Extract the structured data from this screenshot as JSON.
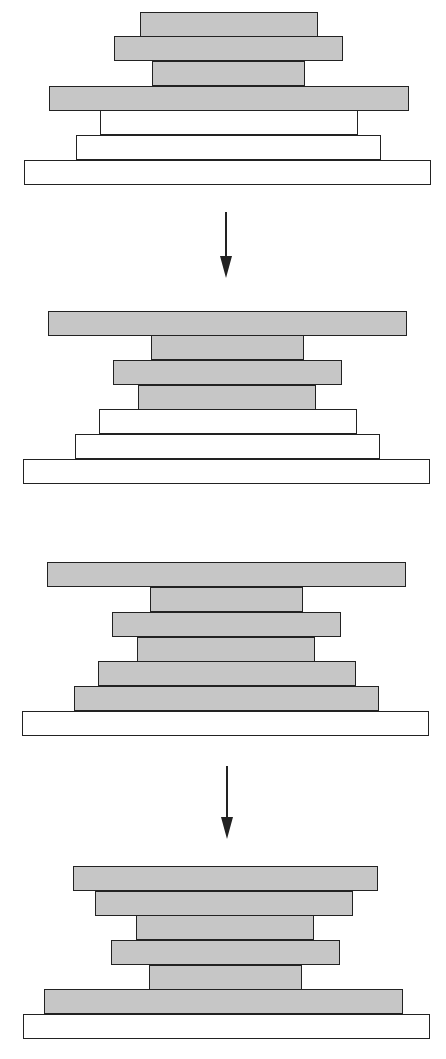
{
  "colors": {
    "background": "#ffffff",
    "gray_fill": "#c6c6c6",
    "white_fill": "#ffffff",
    "stroke": "#222222"
  },
  "diagram": {
    "stacks": [
      {
        "id": "stack-1",
        "bars": [
          {
            "x": 140,
            "y": 12,
            "w": 178,
            "h": 25,
            "fill": "gray"
          },
          {
            "x": 114,
            "y": 36,
            "w": 229,
            "h": 25,
            "fill": "gray"
          },
          {
            "x": 152,
            "y": 61,
            "w": 153,
            "h": 25,
            "fill": "gray"
          },
          {
            "x": 49,
            "y": 86,
            "w": 360,
            "h": 25,
            "fill": "gray"
          },
          {
            "x": 100,
            "y": 110,
            "w": 258,
            "h": 25,
            "fill": "white"
          },
          {
            "x": 76,
            "y": 135,
            "w": 305,
            "h": 25,
            "fill": "white"
          },
          {
            "x": 24,
            "y": 160,
            "w": 407,
            "h": 25,
            "fill": "white"
          }
        ]
      },
      {
        "id": "stack-2",
        "bars": [
          {
            "x": 48,
            "y": 311,
            "w": 359,
            "h": 25,
            "fill": "gray"
          },
          {
            "x": 151,
            "y": 335,
            "w": 153,
            "h": 25,
            "fill": "gray"
          },
          {
            "x": 113,
            "y": 360,
            "w": 229,
            "h": 25,
            "fill": "gray"
          },
          {
            "x": 138,
            "y": 385,
            "w": 178,
            "h": 25,
            "fill": "gray"
          },
          {
            "x": 99,
            "y": 409,
            "w": 258,
            "h": 25,
            "fill": "white"
          },
          {
            "x": 75,
            "y": 434,
            "w": 305,
            "h": 25,
            "fill": "white"
          },
          {
            "x": 23,
            "y": 459,
            "w": 407,
            "h": 25,
            "fill": "white"
          }
        ]
      },
      {
        "id": "stack-3",
        "bars": [
          {
            "x": 47,
            "y": 562,
            "w": 359,
            "h": 25,
            "fill": "gray"
          },
          {
            "x": 150,
            "y": 587,
            "w": 153,
            "h": 25,
            "fill": "gray"
          },
          {
            "x": 112,
            "y": 612,
            "w": 229,
            "h": 25,
            "fill": "gray"
          },
          {
            "x": 137,
            "y": 637,
            "w": 178,
            "h": 25,
            "fill": "gray"
          },
          {
            "x": 98,
            "y": 661,
            "w": 258,
            "h": 25,
            "fill": "gray"
          },
          {
            "x": 74,
            "y": 686,
            "w": 305,
            "h": 25,
            "fill": "gray"
          },
          {
            "x": 22,
            "y": 711,
            "w": 407,
            "h": 25,
            "fill": "white"
          }
        ]
      },
      {
        "id": "stack-4",
        "bars": [
          {
            "x": 73,
            "y": 866,
            "w": 305,
            "h": 25,
            "fill": "gray"
          },
          {
            "x": 95,
            "y": 891,
            "w": 258,
            "h": 25,
            "fill": "gray"
          },
          {
            "x": 136,
            "y": 915,
            "w": 178,
            "h": 25,
            "fill": "gray"
          },
          {
            "x": 111,
            "y": 940,
            "w": 229,
            "h": 25,
            "fill": "gray"
          },
          {
            "x": 149,
            "y": 965,
            "w": 153,
            "h": 25,
            "fill": "gray"
          },
          {
            "x": 44,
            "y": 989,
            "w": 359,
            "h": 25,
            "fill": "gray"
          },
          {
            "x": 23,
            "y": 1014,
            "w": 407,
            "h": 25,
            "fill": "white"
          }
        ]
      }
    ],
    "arrows": [
      {
        "id": "arrow-1",
        "x": 226,
        "y1": 212,
        "y2": 278,
        "direction": "down"
      },
      {
        "id": "arrow-2",
        "x": 227,
        "y1": 766,
        "y2": 839,
        "direction": "down"
      }
    ]
  }
}
